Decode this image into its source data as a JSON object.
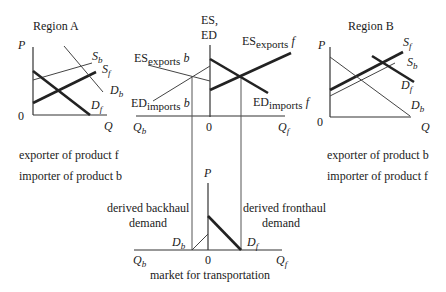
{
  "region_a": {
    "title": "Region A",
    "y_axis": "P",
    "x_axis": "Q",
    "origin": "0",
    "curves": {
      "sb": {
        "main": "S",
        "sub": "b"
      },
      "sf": {
        "main": "S",
        "sub": "f"
      },
      "db": {
        "main": "D",
        "sub": "b"
      },
      "df": {
        "main": "D",
        "sub": "f"
      }
    },
    "caption_1": "exporter of product f",
    "caption_2": "importer of product b"
  },
  "region_b": {
    "title": "Region B",
    "y_axis": "P",
    "x_axis": "Q",
    "origin": "0",
    "curves": {
      "sf": {
        "main": "S",
        "sub": "f"
      },
      "sb": {
        "main": "S",
        "sub": "b"
      },
      "df": {
        "main": "D",
        "sub": "f"
      },
      "db": {
        "main": "D",
        "sub": "b"
      }
    },
    "caption_1": "exporter of product b",
    "caption_2": "importer of product f"
  },
  "excess_market": {
    "y_axis_line1": "ES,",
    "y_axis_line2": "ED",
    "x_left": {
      "main": "Q",
      "sub": "b"
    },
    "x_right": {
      "main": "Q",
      "sub": "f"
    },
    "origin": "0",
    "curves": {
      "es_exports_b": {
        "main": "ES",
        "sub": "exports",
        "tail": "b"
      },
      "ed_imports_b": {
        "main": "ED",
        "sub": "imports",
        "tail": "b"
      },
      "es_exports_f": {
        "main": "ES",
        "sub": "exports",
        "tail": "f"
      },
      "ed_imports_f": {
        "main": "ED",
        "sub": "imports",
        "tail": "f"
      }
    }
  },
  "transport_market": {
    "y_axis": "P",
    "x_left": {
      "main": "Q",
      "sub": "b"
    },
    "x_right": {
      "main": "Q",
      "sub": "f"
    },
    "origin": "0",
    "backhaul_line1": "derived backhaul",
    "backhaul_line2": "demand",
    "fronthaul_line1": "derived fronthaul",
    "fronthaul_line2": "demand",
    "db": {
      "main": "D",
      "sub": "b"
    },
    "df": {
      "main": "D",
      "sub": "f"
    },
    "caption": "market for transportation"
  }
}
